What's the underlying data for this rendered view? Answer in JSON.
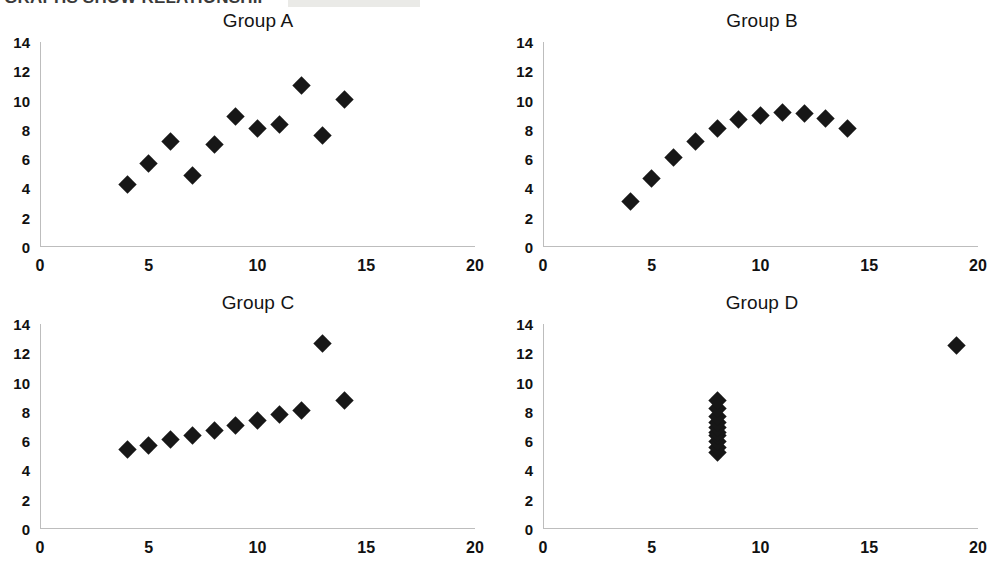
{
  "banner": {
    "headline": "GRAPHS SHOW RELATIONSHIP",
    "highlight_color": "#d8d8d4"
  },
  "axes": {
    "x_ticks": [
      "0",
      "5",
      "10",
      "15",
      "20"
    ],
    "y_ticks": [
      "0",
      "2",
      "4",
      "6",
      "8",
      "10",
      "12",
      "14"
    ],
    "xlim": [
      0,
      20
    ],
    "ylim": [
      0,
      14
    ],
    "axis_color": "#bdbdbd",
    "marker_color": "#171717"
  },
  "chart_data": [
    {
      "type": "scatter",
      "title": "Group A",
      "xlabel": "",
      "ylabel": "",
      "xlim": [
        0,
        20
      ],
      "ylim": [
        0,
        14
      ],
      "grid": false,
      "legend": "none",
      "x": [
        4,
        5,
        6,
        7,
        8,
        9,
        10,
        11,
        12,
        13,
        14
      ],
      "y": [
        4.3,
        5.7,
        7.2,
        4.9,
        7.0,
        8.9,
        8.1,
        8.4,
        11.0,
        7.6,
        10.1
      ]
    },
    {
      "type": "scatter",
      "title": "Group B",
      "xlabel": "",
      "ylabel": "",
      "xlim": [
        0,
        20
      ],
      "ylim": [
        0,
        14
      ],
      "grid": false,
      "legend": "none",
      "x": [
        4,
        5,
        6,
        7,
        8,
        9,
        10,
        11,
        12,
        13,
        14
      ],
      "y": [
        3.1,
        4.7,
        6.1,
        7.2,
        8.1,
        8.7,
        9.0,
        9.2,
        9.1,
        8.8,
        8.1
      ]
    },
    {
      "type": "scatter",
      "title": "Group C",
      "xlabel": "",
      "ylabel": "",
      "xlim": [
        0,
        20
      ],
      "ylim": [
        0,
        14
      ],
      "grid": false,
      "legend": "none",
      "x": [
        4,
        5,
        6,
        7,
        8,
        9,
        10,
        11,
        12,
        13,
        14
      ],
      "y": [
        5.4,
        5.7,
        6.1,
        6.4,
        6.7,
        7.1,
        7.4,
        7.8,
        8.1,
        12.7,
        8.8
      ]
    },
    {
      "type": "scatter",
      "title": "Group D",
      "xlabel": "",
      "ylabel": "",
      "xlim": [
        0,
        20
      ],
      "ylim": [
        0,
        14
      ],
      "grid": false,
      "legend": "none",
      "x": [
        8,
        8,
        8,
        8,
        8,
        8,
        8,
        8,
        8,
        8,
        19
      ],
      "y": [
        5.2,
        5.6,
        6.0,
        6.4,
        6.6,
        6.9,
        7.3,
        7.7,
        8.2,
        8.8,
        12.5
      ]
    }
  ]
}
